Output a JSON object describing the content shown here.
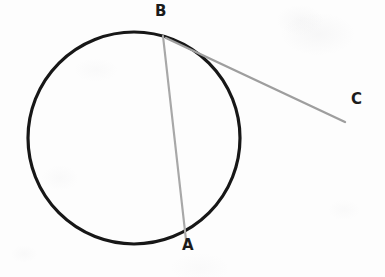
{
  "figure": {
    "background_color": "#fdfdfd",
    "width": 385,
    "height": 277
  },
  "labels": {
    "point_a": "A",
    "point_b": "B",
    "point_c": "C"
  },
  "chart_data": {
    "type": "diagram",
    "xlabel": "",
    "ylabel": "",
    "xlim": [
      0,
      385
    ],
    "ylim": [
      0,
      277
    ],
    "grid": false,
    "legend": "none",
    "shapes": [
      {
        "name": "circle",
        "kind": "circle",
        "cx": 134,
        "cy": 138,
        "r": 106,
        "stroke": "#171717",
        "stroke_width": 3.2,
        "fill": "none"
      },
      {
        "name": "chord-BA",
        "kind": "line",
        "from": "B",
        "to": "A",
        "x1": 163,
        "y1": 36,
        "x2": 186,
        "y2": 240,
        "stroke": "#a8a8a8",
        "stroke_width": 2.2
      },
      {
        "name": "secant-BC",
        "kind": "line",
        "from": "B",
        "to": "C",
        "x1": 166,
        "y1": 38,
        "x2": 345,
        "y2": 122,
        "stroke": "#9e9e9e",
        "stroke_width": 2.4
      }
    ],
    "points": [
      {
        "label": "A",
        "x": 186,
        "y": 240,
        "label_x": 188,
        "label_y": 252,
        "on_circle": true
      },
      {
        "label": "B",
        "x": 163,
        "y": 36,
        "label_x": 161,
        "label_y": 18,
        "on_circle": true
      },
      {
        "label": "C",
        "x": 345,
        "y": 122,
        "label_x": 357,
        "label_y": 106,
        "on_circle": false
      }
    ],
    "colors": {
      "circle_stroke": "#171717",
      "chord_stroke": "#a8a8a8",
      "secant_stroke": "#9e9e9e",
      "label_text": "#1b1b1b",
      "background": "#fdfdfd"
    }
  }
}
